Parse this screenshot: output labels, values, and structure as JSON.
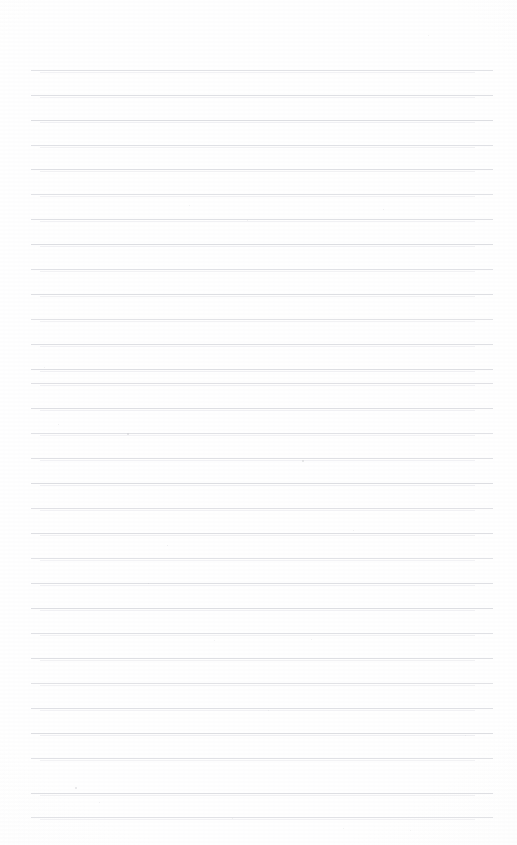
{
  "page": {
    "kind": "scanned-lined-paper",
    "width": 517,
    "height": 845,
    "background_color": "#ffffff",
    "content_text": "",
    "has_handwriting": false,
    "has_print_text": false
  },
  "paper": {
    "tone_color": "#fdfdfd",
    "vignette_color": "#fbfbfc",
    "grain_opacity": 0.5
  },
  "ruling": {
    "line_color": "#dcdde1",
    "echo_color": "#f0f0f3",
    "line_thickness_px": 1,
    "line_count": 31,
    "first_line_y": 70,
    "line_spacing_px": 24.9,
    "line_left_x": 31,
    "line_right_x": 493,
    "line_length_px": 462,
    "lines_y": [
      70,
      95,
      120,
      145,
      169,
      194,
      219,
      244,
      269,
      294,
      319,
      344,
      369,
      383,
      408,
      433,
      458,
      483,
      508,
      533,
      558,
      583,
      608,
      633,
      658,
      683,
      708,
      733,
      758,
      793,
      817
    ]
  },
  "margins": {
    "top_margin_px": 70,
    "bottom_margin_px": 28,
    "left_margin_px": 31,
    "right_margin_px": 24
  },
  "specks": [
    {
      "x": 302,
      "y": 460,
      "size": 2,
      "opacity": 0.55
    },
    {
      "x": 75,
      "y": 787,
      "size": 2,
      "opacity": 0.5
    },
    {
      "x": 127,
      "y": 433,
      "size": 2,
      "opacity": 0.6
    },
    {
      "x": 167,
      "y": 545,
      "size": 1,
      "opacity": 0.35
    },
    {
      "x": 247,
      "y": 220,
      "size": 1,
      "opacity": 0.3
    },
    {
      "x": 383,
      "y": 209,
      "size": 1,
      "opacity": 0.3
    },
    {
      "x": 353,
      "y": 530,
      "size": 1,
      "opacity": 0.3
    },
    {
      "x": 148,
      "y": 583,
      "size": 1,
      "opacity": 0.3
    },
    {
      "x": 99,
      "y": 802,
      "size": 1,
      "opacity": 0.3
    },
    {
      "x": 232,
      "y": 818,
      "size": 1,
      "opacity": 0.3
    },
    {
      "x": 428,
      "y": 35,
      "size": 1,
      "opacity": 0.25
    },
    {
      "x": 189,
      "y": 205,
      "size": 1,
      "opacity": 0.25
    },
    {
      "x": 58,
      "y": 424,
      "size": 1,
      "opacity": 0.3
    },
    {
      "x": 311,
      "y": 639,
      "size": 1,
      "opacity": 0.3
    },
    {
      "x": 268,
      "y": 710,
      "size": 1,
      "opacity": 0.25
    },
    {
      "x": 465,
      "y": 735,
      "size": 1,
      "opacity": 0.25
    },
    {
      "x": 44,
      "y": 367,
      "size": 1,
      "opacity": 0.25
    },
    {
      "x": 214,
      "y": 640,
      "size": 1,
      "opacity": 0.25
    },
    {
      "x": 343,
      "y": 828,
      "size": 1,
      "opacity": 0.25
    },
    {
      "x": 410,
      "y": 830,
      "size": 1,
      "opacity": 0.25
    }
  ]
}
